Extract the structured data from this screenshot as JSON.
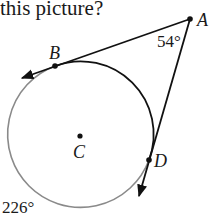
{
  "question_fragment": "this picture?",
  "diagram": {
    "circle": {
      "center_label": "C",
      "cx": 80,
      "cy": 136,
      "r": 73
    },
    "points": {
      "A": {
        "label": "A",
        "x": 190,
        "y": 19
      },
      "B": {
        "label": "B",
        "x": 55,
        "y": 66
      },
      "C": {
        "label": "C",
        "x": 80,
        "y": 136
      },
      "D": {
        "label": "D",
        "x": 149,
        "y": 160
      }
    },
    "angle_at_A": "54°",
    "major_arc_measure": "226°",
    "colors": {
      "line": "#111111",
      "minor_arc": "#111111",
      "major_arc": "#8a8a8a",
      "text": "#1a1a1a"
    }
  }
}
